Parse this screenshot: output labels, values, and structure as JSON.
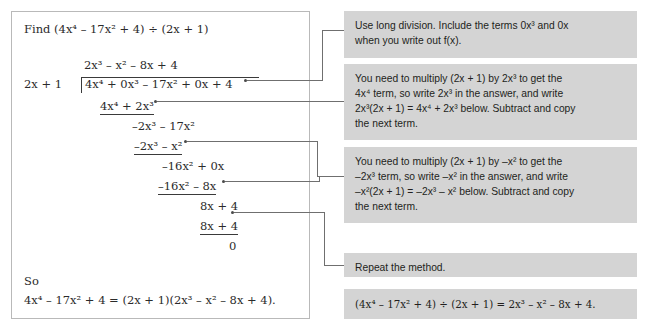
{
  "page": {
    "background": "#ffffff",
    "callout_background": "#d4d4d4",
    "panel_border": "#b9b9b9",
    "connector_color": "#6f6f6f"
  },
  "work_panel": {
    "prompt": "Find (4x⁴ – 17x² + 4) ÷ (2x + 1)",
    "quotient": "2x³ – x² – 8x + 4",
    "divisor": "2x + 1",
    "dividend": "4x⁴ + 0x³ – 17x² + 0x + 4",
    "steps": [
      {
        "subtract": "4x⁴ + 2x³",
        "remainder": "–2x³ – 17x²"
      },
      {
        "subtract": "–2x³ – x²",
        "remainder": "–16x² + 0x"
      },
      {
        "subtract": "–16x² – 8x",
        "remainder": "8x + 4"
      },
      {
        "subtract": "8x + 4",
        "remainder": "0"
      }
    ],
    "so_label": "So",
    "conclusion": "4x⁴ – 17x² + 4 = (2x + 1)(2x³ – x² – 8x + 4)."
  },
  "callouts": [
    {
      "id": "callout-use-long-division",
      "lines": [
        "Use long division. Include the terms 0x³ and 0x",
        "when you write out f(x)."
      ]
    },
    {
      "id": "callout-multiply-by-2x3",
      "lines": [
        "You need to multiply (2x + 1) by 2x³ to get the",
        "4x⁴ term, so write 2x³ in the answer, and write",
        "2x³(2x + 1) = 4x⁴ + 2x³ below. Subtract and copy",
        "the next term."
      ]
    },
    {
      "id": "callout-multiply-by-minus-x2",
      "lines": [
        "You need to multiply (2x + 1) by –x² to get the",
        "–2x³ term, so write –x² in the answer, and write",
        "–x²(2x + 1) = –2x³ – x² below. Subtract and copy",
        "the next term."
      ]
    },
    {
      "id": "callout-repeat",
      "lines": [
        "Repeat the method."
      ]
    },
    {
      "id": "callout-result",
      "lines": [
        "(4x⁴ – 17x² + 4) ÷ (2x + 1) = 2x³ – x² – 8x + 4."
      ]
    }
  ]
}
